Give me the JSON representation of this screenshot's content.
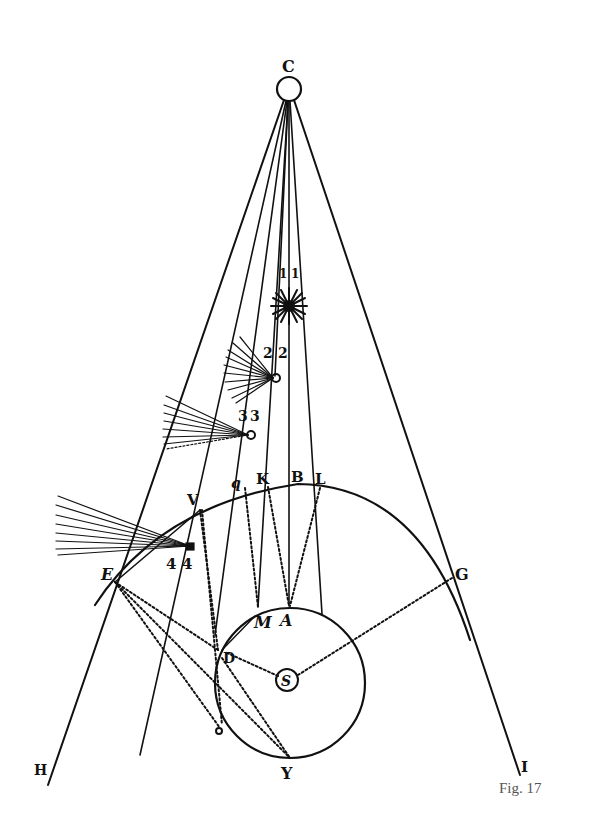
{
  "figure": {
    "caption": "Fig. 17",
    "type": "geometric optics / astronomical diagram",
    "labels": {
      "C": "C",
      "S": "S",
      "A": "A",
      "M": "M",
      "D": "D",
      "E": "E",
      "G": "G",
      "V": "V",
      "q": "q",
      "K": "K",
      "B": "B",
      "L": "L",
      "H": "H",
      "I": "I",
      "Y": "Y",
      "O": "o",
      "n1a": "1",
      "n1b": "1",
      "n2a": "2",
      "n2b": "2",
      "n3a": "3",
      "n3b": "3",
      "n4a": "4",
      "n4b": "4"
    },
    "elements": [
      "small circle C at apex",
      "radiating lines from C to H and I",
      "star-burst body at position 1",
      "comet bodies with tails at positions 2, 3, 4",
      "large arc E-V-q-K-B-L-G",
      "circle centered on S with points A, M, D, Y",
      "dotted lines from S to D and G, from E to D/O/Y"
    ]
  }
}
